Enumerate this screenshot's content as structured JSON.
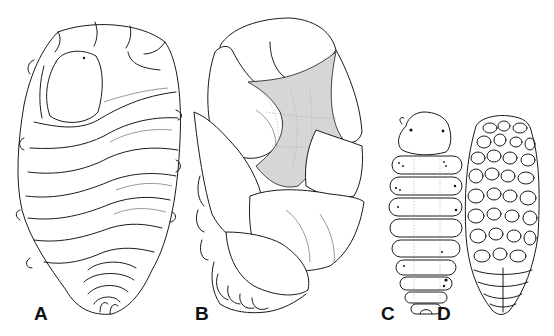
{
  "figure": {
    "panels": [
      {
        "id": "A",
        "label": "A",
        "view": "dorsal oblique view, segmented oval body with large head shield"
      },
      {
        "id": "B",
        "label": "B",
        "view": "lateral view with large overlapping plates and stippled membrane"
      },
      {
        "id": "C",
        "label": "C",
        "view": "small dorsal view, segmented larva-like body with dark speckles"
      },
      {
        "id": "D",
        "label": "D",
        "view": "small ventral view, body covered with many oval plates"
      }
    ],
    "colors": {
      "background": "#ffffff",
      "ink": "#1a1a1a",
      "stipple": "#9a9a9a"
    }
  }
}
